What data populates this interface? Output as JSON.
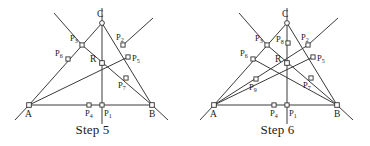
{
  "figures": [
    {
      "id": "step5",
      "caption": "Step 5",
      "vertices": [
        {
          "name": "A",
          "label": "A",
          "x": 29,
          "y": 105,
          "label_x": 25,
          "label_y": 117,
          "shape": "square"
        },
        {
          "name": "B",
          "label": "B",
          "x": 152,
          "y": 105,
          "label_x": 149,
          "label_y": 117,
          "shape": "square"
        },
        {
          "name": "C",
          "label": "C",
          "x": 102,
          "y": 23,
          "label_x": 97,
          "label_y": 17,
          "shape": "circle"
        },
        {
          "name": "R",
          "label": "R",
          "x": 102,
          "y": 63,
          "label_x": 90,
          "label_y": 62,
          "shape": "square"
        }
      ],
      "points": [
        {
          "name": "P1",
          "label": "P",
          "sub": "1",
          "x": 102,
          "y": 105,
          "label_x": 104,
          "label_y": 116
        },
        {
          "name": "P2",
          "label": "P",
          "sub": "2",
          "x": 123,
          "y": 45,
          "label_x": 116,
          "label_y": 40
        },
        {
          "name": "P3",
          "label": "P",
          "sub": "3",
          "x": 82,
          "y": 45,
          "label_x": 70,
          "label_y": 41
        },
        {
          "name": "P4",
          "label": "P",
          "sub": "4",
          "x": 89,
          "y": 105,
          "label_x": 85,
          "label_y": 116
        },
        {
          "name": "P5",
          "label": "P",
          "sub": "5",
          "x": 128,
          "y": 57,
          "label_x": 132,
          "label_y": 61
        },
        {
          "name": "P6",
          "label": "P",
          "sub": "6",
          "x": 68,
          "y": 59,
          "label_x": 55,
          "label_y": 56
        },
        {
          "name": "P7",
          "label": "P",
          "sub": "7",
          "x": 126,
          "y": 78,
          "label_x": 118,
          "label_y": 88
        }
      ],
      "edges": [
        {
          "name": "side-ab",
          "x1": 29,
          "y1": 105,
          "x2": 152,
          "y2": 105
        },
        {
          "name": "side-ac",
          "x1": 29,
          "y1": 105,
          "x2": 102,
          "y2": 23
        },
        {
          "name": "side-bc",
          "x1": 152,
          "y1": 105,
          "x2": 102,
          "y2": 23
        },
        {
          "name": "cevian-a-to-p5",
          "x1": 29,
          "y1": 105,
          "x2": 128,
          "y2": 57
        },
        {
          "name": "cevian-b-to-p3",
          "x1": 152,
          "y1": 105,
          "x2": 82,
          "y2": 45
        }
      ],
      "rays": [
        {
          "name": "ray-vertical-through-c-r-p1",
          "x1": 102,
          "y1": 8,
          "x2": 102,
          "y2": 128
        },
        {
          "name": "ray-upper-left-through-p3",
          "x1": 54,
          "y1": 13,
          "x2": 82,
          "y2": 45
        },
        {
          "name": "ray-upper-right-through-p2",
          "x1": 153,
          "y1": 18,
          "x2": 123,
          "y2": 45
        },
        {
          "name": "ray-lower-left-past-a",
          "x1": 29,
          "y1": 105,
          "x2": 15,
          "y2": 120
        },
        {
          "name": "ray-lower-right-past-b",
          "x1": 152,
          "y1": 105,
          "x2": 168,
          "y2": 120
        }
      ]
    },
    {
      "id": "step6",
      "caption": "Step 6",
      "vertices": [
        {
          "name": "A",
          "label": "A",
          "x": 29,
          "y": 105,
          "label_x": 25,
          "label_y": 117,
          "shape": "square"
        },
        {
          "name": "B",
          "label": "B",
          "x": 152,
          "y": 105,
          "label_x": 149,
          "label_y": 117,
          "shape": "square"
        },
        {
          "name": "C",
          "label": "C",
          "x": 102,
          "y": 23,
          "label_x": 97,
          "label_y": 17,
          "shape": "circle"
        },
        {
          "name": "R",
          "label": "R",
          "x": 102,
          "y": 63,
          "label_x": 90,
          "label_y": 62,
          "shape": "square"
        }
      ],
      "points": [
        {
          "name": "P1",
          "label": "P",
          "sub": "1",
          "x": 102,
          "y": 105,
          "label_x": 104,
          "label_y": 116
        },
        {
          "name": "P2",
          "label": "P",
          "sub": "2",
          "x": 123,
          "y": 45,
          "label_x": 116,
          "label_y": 40
        },
        {
          "name": "P3",
          "label": "P",
          "sub": "3",
          "x": 82,
          "y": 45,
          "label_x": 70,
          "label_y": 41
        },
        {
          "name": "P4",
          "label": "P",
          "sub": "4",
          "x": 89,
          "y": 105,
          "label_x": 85,
          "label_y": 116
        },
        {
          "name": "P5",
          "label": "P",
          "sub": "5",
          "x": 128,
          "y": 57,
          "label_x": 132,
          "label_y": 61
        },
        {
          "name": "P6",
          "label": "P",
          "sub": "6",
          "x": 68,
          "y": 59,
          "label_x": 55,
          "label_y": 56
        },
        {
          "name": "P7",
          "label": "P",
          "sub": "7",
          "x": 126,
          "y": 78,
          "label_x": 118,
          "label_y": 88
        },
        {
          "name": "P8",
          "label": "P",
          "sub": "8",
          "x": 103,
          "y": 43,
          "label_x": 91,
          "label_y": 42
        },
        {
          "name": "P9",
          "label": "P",
          "sub": "9",
          "x": 71,
          "y": 79,
          "label_x": 64,
          "label_y": 90
        }
      ],
      "edges": [
        {
          "name": "side-ab",
          "x1": 29,
          "y1": 105,
          "x2": 152,
          "y2": 105
        },
        {
          "name": "side-ac",
          "x1": 29,
          "y1": 105,
          "x2": 102,
          "y2": 23
        },
        {
          "name": "side-bc",
          "x1": 152,
          "y1": 105,
          "x2": 102,
          "y2": 23
        },
        {
          "name": "cevian-a-to-p5",
          "x1": 29,
          "y1": 105,
          "x2": 128,
          "y2": 57
        },
        {
          "name": "cevian-b-to-p3",
          "x1": 152,
          "y1": 105,
          "x2": 82,
          "y2": 45
        },
        {
          "name": "cevian-a-to-p2",
          "x1": 29,
          "y1": 105,
          "x2": 123,
          "y2": 45
        },
        {
          "name": "cevian-b-to-p6",
          "x1": 152,
          "y1": 105,
          "x2": 68,
          "y2": 59
        }
      ],
      "rays": [
        {
          "name": "ray-vertical-through-c-r-p1",
          "x1": 102,
          "y1": 8,
          "x2": 102,
          "y2": 128
        },
        {
          "name": "ray-upper-left-through-p3",
          "x1": 54,
          "y1": 13,
          "x2": 82,
          "y2": 45
        },
        {
          "name": "ray-upper-right-through-p2",
          "x1": 153,
          "y1": 18,
          "x2": 123,
          "y2": 45
        },
        {
          "name": "ray-lower-left-past-a",
          "x1": 29,
          "y1": 105,
          "x2": 15,
          "y2": 120
        },
        {
          "name": "ray-lower-right-past-b",
          "x1": 152,
          "y1": 105,
          "x2": 168,
          "y2": 120
        }
      ]
    }
  ],
  "style": {
    "line_color": "#3a3a3a",
    "node_fill": "#ffffff",
    "node_stroke": "#2e2e2e",
    "text_color": "#1a1a1a",
    "background": "#ffffff"
  }
}
